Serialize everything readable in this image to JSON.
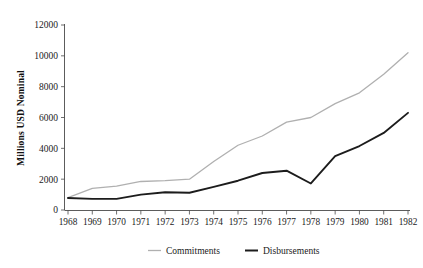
{
  "chart_data": {
    "type": "line",
    "title": "",
    "xlabel": "",
    "ylabel": "Millions USD Nominal",
    "categories": [
      "1968",
      "1969",
      "1970",
      "1971",
      "1972",
      "1973",
      "1974",
      "1975",
      "1976",
      "1977",
      "1978",
      "1979",
      "1980",
      "1981",
      "1982"
    ],
    "x": [
      1968,
      1969,
      1970,
      1971,
      1972,
      1973,
      1974,
      1975,
      1976,
      1977,
      1978,
      1979,
      1980,
      1981,
      1982
    ],
    "series": [
      {
        "name": "Commitments",
        "color": "#b0b0b0",
        "values": [
          800,
          1400,
          1550,
          1850,
          1900,
          2000,
          3150,
          4200,
          4800,
          5700,
          6000,
          6900,
          7600,
          8800,
          10200
        ]
      },
      {
        "name": "Disbursements",
        "color": "#1c1c1c",
        "values": [
          780,
          720,
          720,
          1000,
          1150,
          1120,
          1500,
          1900,
          2400,
          2550,
          1720,
          3500,
          4150,
          5000,
          6300
        ]
      }
    ],
    "yticks": [
      0,
      2000,
      4000,
      6000,
      8000,
      10000,
      12000
    ],
    "ytick_labels": [
      "0",
      "2000",
      "4000",
      "6000",
      "8000",
      "10000",
      "12000"
    ],
    "ylim": [
      0,
      12000
    ],
    "xlim": [
      1968,
      1982
    ],
    "grid": false,
    "legend_position": "bottom"
  },
  "legend": {
    "items": [
      {
        "label": "Commitments",
        "color": "#b0b0b0"
      },
      {
        "label": "Disbursements",
        "color": "#1c1c1c"
      }
    ]
  },
  "axes": {
    "y_axis_title": "Millions USD Nominal"
  }
}
